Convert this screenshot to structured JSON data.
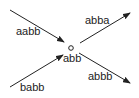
{
  "diagram": {
    "center": {
      "label": "abb"
    },
    "edges": [
      {
        "label": "aabb",
        "direction": "in"
      },
      {
        "label": "babb",
        "direction": "in"
      },
      {
        "label": "abba",
        "direction": "out"
      },
      {
        "label": "abbb",
        "direction": "out"
      }
    ],
    "colors": {
      "stroke": "#222222",
      "background": "#ffffff"
    }
  }
}
